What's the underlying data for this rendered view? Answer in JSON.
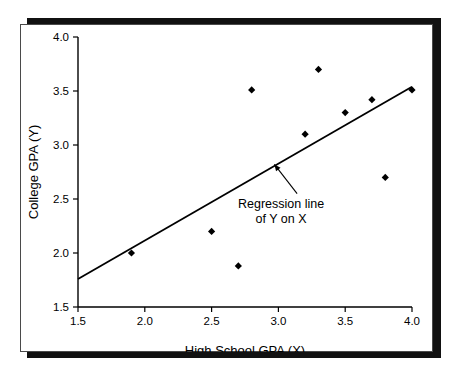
{
  "chart_data": {
    "type": "scatter",
    "title": "",
    "xlabel": "High School GPA (X)",
    "ylabel": "College GPA (Y)",
    "xlim": [
      1.5,
      4.0
    ],
    "ylim": [
      1.5,
      4.0
    ],
    "grid": false,
    "legend": "none",
    "x_ticks": [
      "1.5",
      "2.0",
      "2.5",
      "3.0",
      "3.5",
      "4.0"
    ],
    "x_tick_values": [
      1.5,
      2.0,
      2.5,
      3.0,
      3.5,
      4.0
    ],
    "y_ticks": [
      "1.5",
      "2.0",
      "2.5",
      "3.0",
      "3.5",
      "4.0"
    ],
    "y_tick_values": [
      1.5,
      2.0,
      2.5,
      3.0,
      3.5,
      4.0
    ],
    "series": [
      {
        "name": "Students",
        "marker": "diamond",
        "color": "#000000",
        "points": [
          {
            "x": 1.9,
            "y": 2.0
          },
          {
            "x": 2.5,
            "y": 2.2
          },
          {
            "x": 2.7,
            "y": 1.88
          },
          {
            "x": 2.8,
            "y": 3.51
          },
          {
            "x": 3.2,
            "y": 3.1
          },
          {
            "x": 3.3,
            "y": 3.7
          },
          {
            "x": 3.5,
            "y": 3.3
          },
          {
            "x": 3.7,
            "y": 3.42
          },
          {
            "x": 3.8,
            "y": 2.7
          },
          {
            "x": 4.0,
            "y": 3.51
          }
        ]
      }
    ],
    "trendline": {
      "name": "Regression line of Y on X",
      "color": "#000000",
      "x_start": 1.5,
      "y_start": 1.76,
      "x_end": 4.0,
      "y_end": 3.54
    },
    "annotations": [
      {
        "name": "regression-line-callout",
        "line1": "Regression line",
        "line2": "of Y on X",
        "text_x": 3.02,
        "text_y": 2.42,
        "arrow_from_x": 3.14,
        "arrow_from_y": 2.55,
        "arrow_to_x": 2.97,
        "arrow_to_y": 2.82
      }
    ]
  },
  "colors": {
    "background": "#ffffff",
    "frame_border": "#4a4a4a",
    "shadow": "#111111",
    "ink": "#000000"
  }
}
